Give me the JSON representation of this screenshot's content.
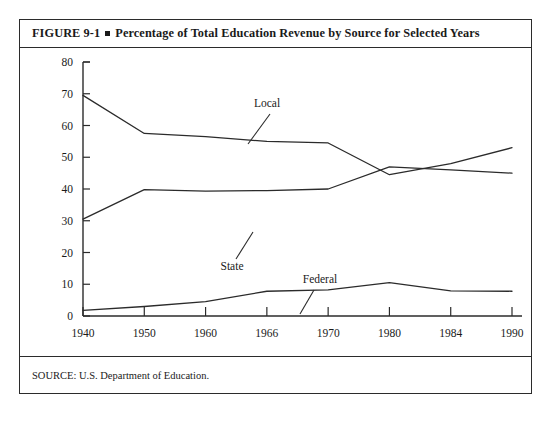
{
  "figure": {
    "caption_prefix": "FIGURE 9-1",
    "caption_title": "Percentage of Total Education Revenue by Source for Selected Years",
    "source_note": "SOURCE: U.S. Department of Education."
  },
  "chart_data": {
    "type": "line",
    "title": "Percentage of Total Education Revenue by Source for Selected Years",
    "xlabel": "",
    "ylabel": "",
    "categories": [
      "1940",
      "1950",
      "1960",
      "1966",
      "1970",
      "1980",
      "1984",
      "1990"
    ],
    "x_tick_labels": [
      "1940",
      "1950",
      "1960",
      "1966",
      "1970",
      "1980",
      "1984",
      "1990"
    ],
    "y_tick_labels": [
      "0",
      "10",
      "20",
      "30",
      "40",
      "50",
      "60",
      "70",
      "80"
    ],
    "ylim": [
      0,
      80
    ],
    "y_tick_step": 10,
    "grid": false,
    "legend_position": "inline-annotations",
    "series": [
      {
        "name": "Local",
        "label": "Local",
        "values": [
          69.5,
          57.5,
          56.5,
          55.0,
          54.5,
          44.5,
          48.0,
          53.0
        ],
        "color": "#2b2b2b"
      },
      {
        "name": "State",
        "label": "State",
        "values": [
          30.5,
          39.8,
          39.3,
          39.5,
          40.0,
          47.0,
          46.0,
          45.0
        ],
        "color": "#2b2b2b"
      },
      {
        "name": "Federal",
        "label": "Federal",
        "values": [
          1.8,
          3.0,
          4.5,
          7.8,
          8.2,
          10.5,
          7.9,
          7.8
        ],
        "color": "#2b2b2b"
      }
    ],
    "annotations": [
      {
        "text": "Local",
        "series": "Local"
      },
      {
        "text": "State",
        "series": "State"
      },
      {
        "text": "Federal",
        "series": "Federal"
      }
    ]
  }
}
